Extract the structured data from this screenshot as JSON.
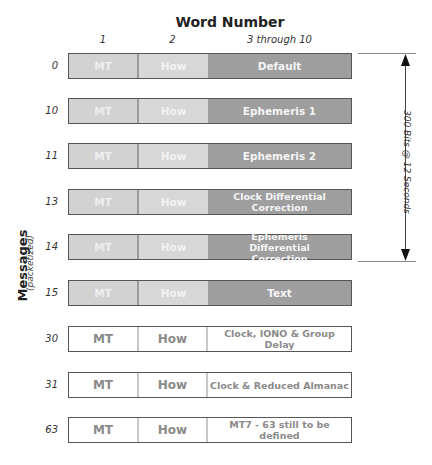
{
  "title": "Word Number",
  "columns": [
    {
      "label": "1"
    },
    {
      "label": "2"
    },
    {
      "label": "3 through 10"
    }
  ],
  "axis_label": {
    "main": "Messages",
    "sub": "(packetized)"
  },
  "dimension": {
    "label": "300 Bits @ 12 Seconds"
  },
  "rows": [
    {
      "label": "0",
      "word1": "MT",
      "word2": "How",
      "content": "Default",
      "style": "filled"
    },
    {
      "label": "10",
      "word1": "MT",
      "word2": "How",
      "content": "Ephemeris 1",
      "style": "filled"
    },
    {
      "label": "11",
      "word1": "MT",
      "word2": "How",
      "content": "Ephemeris 2",
      "style": "filled"
    },
    {
      "label": "13",
      "word1": "MT",
      "word2": "How",
      "content": "Clock Differential Correction",
      "style": "filled"
    },
    {
      "label": "14",
      "word1": "MT",
      "word2": "How",
      "content": "Ephemeris Differential Correction",
      "style": "filled"
    },
    {
      "label": "15",
      "word1": "MT",
      "word2": "How",
      "content": "Text",
      "style": "filled"
    },
    {
      "label": "30",
      "word1": "MT",
      "word2": "How",
      "content": "Clock, IONO & Group Delay",
      "style": "open"
    },
    {
      "label": "31",
      "word1": "MT",
      "word2": "How",
      "content": "Clock & Reduced Almanac",
      "style": "open"
    },
    {
      "label": "63",
      "word1": "MT",
      "word2": "How",
      "content": "MT7 - 63 still to be defined",
      "style": "open"
    }
  ],
  "colors": {
    "word1_fill": "#d2d2d2",
    "word2_fill": "#d7d7d7",
    "content_fill": "#9e9e9e",
    "outline": "#555555",
    "open_text": "#8a8a8a"
  }
}
